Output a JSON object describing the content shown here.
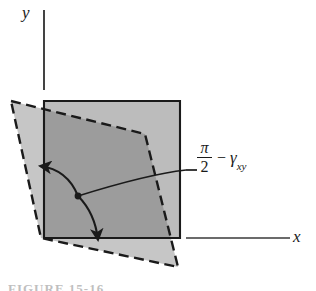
{
  "figure": {
    "type": "engineering-mechanics-diagram",
    "axes": {
      "y_label": "y",
      "x_label": "x",
      "y_axis_line": {
        "x1": 44,
        "y1": 10,
        "x2": 44,
        "y2": 90
      },
      "x_axis_line": {
        "x1": 186,
        "y1": 238,
        "x2": 290,
        "y2": 238
      }
    },
    "annotation": {
      "numerator": "π",
      "denominator": "2",
      "operator": "−",
      "symbol": "γ",
      "subscript": "xy",
      "full_text": "π/2 − γxy",
      "leader_line": {
        "x1": 186,
        "y1": 170,
        "x2": 196,
        "y2": 170
      }
    },
    "shapes": {
      "solid_square": {
        "name": "original-element",
        "stroke": "#1a1a1a",
        "fill": "#b8b8b8",
        "points": "44,101 180,101 180,238 44,238"
      },
      "dashed_parallelogram": {
        "name": "deformed-element",
        "stroke": "#1a1a1a",
        "fill": "#c4c4c4",
        "dash": "9,5",
        "points": "11,101 145,134 178,267 41,238"
      },
      "overlap_fill": "#9a9a9a"
    },
    "arcs": {
      "vertex_dot": {
        "cx": 78,
        "cy": 196,
        "r": 3.2
      },
      "arc_to_upper_left_arrow": "angle arc terminating with arrowhead on the deformed left edge",
      "arc_to_lower_arrow": "angle arc terminating with arrowhead on the deformed bottom edge",
      "arc_to_label": "leader arc running right to the angle annotation"
    },
    "caption": "FIGURE 15-16"
  }
}
